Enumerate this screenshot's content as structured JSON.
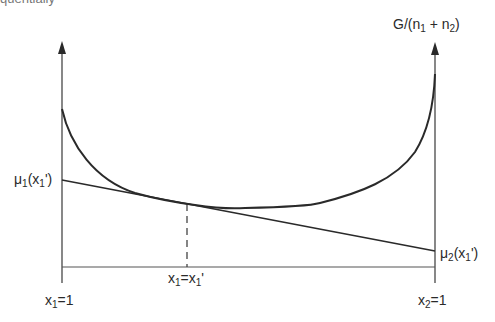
{
  "caption_fragment": "quentially",
  "y_axis_label": {
    "main": "G/(n",
    "sub1": "1",
    "plus": " + n",
    "sub2": "2",
    "close": ")"
  },
  "left_intercept_label": {
    "mu": "μ",
    "sub": "1",
    "arg": "(x",
    "argsub": "1",
    "prime": "')"
  },
  "right_intercept_label": {
    "mu": "μ",
    "sub": "2",
    "arg": "(x",
    "argsub": "1",
    "prime": "')"
  },
  "tangent_point_label": {
    "a": "x",
    "asub": "1",
    "eq": "=x",
    "bsub": "1",
    "prime": "'"
  },
  "left_axis_label": {
    "a": "x",
    "asub": "1",
    "rest": "=1"
  },
  "right_axis_label": {
    "a": "x",
    "asub": "2",
    "rest": "=1"
  },
  "colors": {
    "line": "#2a2a2a",
    "background": "#ffffff"
  }
}
